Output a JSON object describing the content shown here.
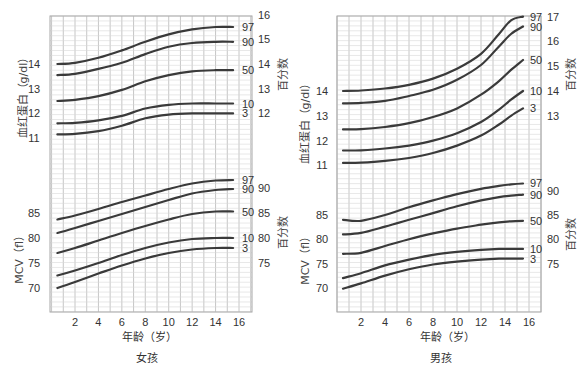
{
  "chart_data": [
    {
      "type": "line",
      "panel": "女孩",
      "title": "女孩",
      "xlabel": "年龄（岁）",
      "x_ticks": [
        2,
        4,
        6,
        8,
        10,
        12,
        14,
        16
      ],
      "x": [
        0.5,
        2,
        4,
        6,
        8,
        10,
        12,
        14,
        15.5
      ],
      "hemoglobin": {
        "ylabel": "血红蛋白（g/dl）",
        "right_label": "百分数",
        "left_ticks": [
          11,
          12,
          13,
          14
        ],
        "right_ticks": [
          12,
          13,
          14,
          15,
          16
        ],
        "series": [
          {
            "name": "97",
            "values": [
              14.0,
              14.05,
              14.25,
              14.55,
              14.9,
              15.2,
              15.4,
              15.5,
              15.5
            ]
          },
          {
            "name": "90",
            "values": [
              13.55,
              13.6,
              13.8,
              14.05,
              14.4,
              14.7,
              14.85,
              14.9,
              14.9
            ]
          },
          {
            "name": "50",
            "values": [
              12.5,
              12.55,
              12.7,
              12.95,
              13.3,
              13.55,
              13.7,
              13.75,
              13.75
            ]
          },
          {
            "name": "10",
            "values": [
              11.6,
              11.62,
              11.72,
              11.9,
              12.2,
              12.35,
              12.4,
              12.4,
              12.4
            ]
          },
          {
            "name": "3",
            "values": [
              11.15,
              11.17,
              11.28,
              11.5,
              11.8,
              11.95,
              12.0,
              12.0,
              12.0
            ]
          }
        ]
      },
      "mcv": {
        "ylabel": "MCV（fl）",
        "right_label": "百分数",
        "left_ticks": [
          70,
          75,
          80,
          85
        ],
        "right_ticks": [
          75,
          80,
          85,
          90
        ],
        "series": [
          {
            "name": "97",
            "values": [
              83.7,
              84.5,
              85.8,
              87.2,
              88.5,
              89.8,
              90.9,
              91.5,
              91.6
            ]
          },
          {
            "name": "90",
            "values": [
              81.0,
              82.0,
              83.4,
              84.8,
              86.2,
              87.6,
              88.9,
              89.6,
              89.8
            ]
          },
          {
            "name": "50",
            "values": [
              77.0,
              78.0,
              79.5,
              81.0,
              82.4,
              83.7,
              84.8,
              85.3,
              85.3
            ]
          },
          {
            "name": "10",
            "values": [
              72.5,
              73.5,
              75.0,
              76.6,
              78.0,
              79.1,
              79.8,
              80.0,
              80.0
            ]
          },
          {
            "name": "3",
            "values": [
              70.0,
              71.2,
              72.9,
              74.5,
              75.9,
              77.0,
              77.7,
              78.0,
              78.0
            ]
          }
        ]
      }
    },
    {
      "type": "line",
      "panel": "男孩",
      "title": "男孩",
      "xlabel": "年龄（岁）",
      "x_ticks": [
        2,
        4,
        6,
        8,
        10,
        12,
        14,
        16
      ],
      "x": [
        0.5,
        2,
        4,
        6,
        8,
        10,
        12,
        13.5,
        14.5,
        15.5
      ],
      "hemoglobin": {
        "ylabel": "血红蛋白（g/dl）",
        "right_label": "百分数",
        "left_ticks": [
          11,
          12,
          13,
          14
        ],
        "right_ticks": [
          13,
          14,
          15,
          16,
          17
        ],
        "series": [
          {
            "name": "97",
            "values": [
              14.0,
              14.02,
              14.1,
              14.25,
              14.5,
              14.9,
              15.5,
              16.3,
              16.85,
              17.0
            ]
          },
          {
            "name": "90",
            "values": [
              13.5,
              13.52,
              13.6,
              13.8,
              14.05,
              14.45,
              15.05,
              15.8,
              16.3,
              16.6
            ]
          },
          {
            "name": "50",
            "values": [
              12.45,
              12.46,
              12.55,
              12.7,
              12.95,
              13.3,
              13.85,
              14.4,
              14.85,
              15.25
            ]
          },
          {
            "name": "10",
            "values": [
              11.6,
              11.61,
              11.68,
              11.8,
              12.0,
              12.3,
              12.75,
              13.25,
              13.65,
              14.0
            ]
          },
          {
            "name": "3",
            "values": [
              11.1,
              11.11,
              11.18,
              11.3,
              11.5,
              11.8,
              12.2,
              12.65,
              13.0,
              13.3
            ]
          }
        ]
      },
      "mcv": {
        "ylabel": "MCV（fl）",
        "right_label": "百分数",
        "left_ticks": [
          70,
          75,
          80,
          85
        ],
        "right_ticks": [
          75,
          80,
          85,
          90
        ],
        "series": [
          {
            "name": "97",
            "values": [
              84.0,
              83.8,
              85.0,
              86.6,
              88.0,
              89.3,
              90.4,
              91.0,
              91.3,
              91.5
            ]
          },
          {
            "name": "90",
            "values": [
              81.0,
              81.3,
              82.6,
              84.0,
              85.4,
              86.8,
              88.0,
              88.7,
              89.0,
              89.2
            ]
          },
          {
            "name": "50",
            "values": [
              77.0,
              77.2,
              78.6,
              80.0,
              81.2,
              82.2,
              83.0,
              83.5,
              83.7,
              83.8
            ]
          },
          {
            "name": "10",
            "values": [
              72.0,
              73.0,
              74.6,
              75.8,
              76.8,
              77.4,
              77.8,
              78.0,
              78.0,
              78.0
            ]
          },
          {
            "name": "3",
            "values": [
              69.8,
              70.9,
              72.5,
              73.8,
              74.8,
              75.4,
              75.8,
              76.0,
              76.0,
              76.0
            ]
          }
        ]
      }
    }
  ],
  "panels": [
    {
      "title": "女孩",
      "xlabel": "年龄（岁）",
      "hb_ylabel": "血红蛋白（g/dl）",
      "mcv_ylabel": "MCV（fl）",
      "right_label": "百分数"
    },
    {
      "title": "男孩",
      "xlabel": "年龄（岁）",
      "hb_ylabel": "血红蛋白（g/dl）",
      "mcv_ylabel": "MCV（fl）",
      "right_label": "百分数"
    }
  ]
}
